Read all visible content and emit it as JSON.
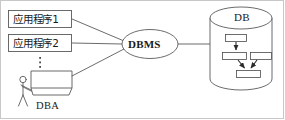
{
  "figure": {
    "background": "#ffffff",
    "stroke": "#5a5a5a",
    "text_color": "#1a1a1a",
    "frame": {
      "visible": true,
      "color": "#c8c8c8"
    }
  },
  "nodes": {
    "app1": {
      "label": "应用程序1",
      "shape": "rectangle"
    },
    "app2": {
      "label": "应用程序2",
      "shape": "rectangle"
    },
    "ellipsis": {
      "label": "⋮",
      "shape": "vertical-dots"
    },
    "terminal": {
      "label": "",
      "shape": "console-desk"
    },
    "dba_person": {
      "label": "",
      "shape": "stick-figure"
    },
    "dba": {
      "label": "DBA",
      "shape": "text"
    },
    "dbms": {
      "label": "DBMS",
      "shape": "ellipse"
    },
    "db": {
      "label": "DB",
      "shape": "cylinder"
    }
  },
  "db_internal": {
    "boxes": [
      {
        "id": "root",
        "label": ""
      },
      {
        "id": "child-left",
        "label": ""
      },
      {
        "id": "child-right",
        "label": ""
      },
      {
        "id": "leaf",
        "label": ""
      }
    ],
    "arrows": [
      {
        "from": "root",
        "to": "child-left"
      },
      {
        "from": "child-left",
        "to": "leaf"
      },
      {
        "from": "child-right",
        "to": "leaf"
      }
    ]
  },
  "connections": [
    {
      "from": "app1",
      "to": "dbms"
    },
    {
      "from": "app2",
      "to": "dbms"
    },
    {
      "from": "terminal",
      "to": "dbms"
    },
    {
      "from": "dbms",
      "to": "db"
    }
  ]
}
